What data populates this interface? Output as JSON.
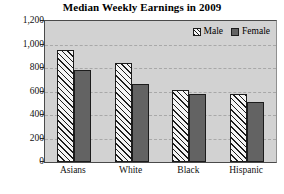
{
  "chart_data": {
    "type": "bar",
    "title": "Median Weekly Earnings in 2009",
    "xlabel": "",
    "ylabel": "",
    "categories": [
      "Asians",
      "White",
      "Black",
      "Hispanic"
    ],
    "series": [
      {
        "name": "Male",
        "values": [
          950,
          845,
          615,
          575
        ]
      },
      {
        "name": "Female",
        "values": [
          780,
          660,
          580,
          510
        ]
      }
    ],
    "ylim": [
      0,
      1200
    ],
    "yticks": [
      0,
      200,
      400,
      600,
      800,
      1000,
      1200
    ],
    "ytick_labels": [
      "0",
      "200",
      "400",
      "600",
      "800",
      "1,000",
      "1,200"
    ],
    "grid": true,
    "legend_position": "top-right",
    "colors": {
      "male": "#f4f4f4",
      "female": "#636363",
      "outline": "#1c1c1c",
      "plot_background": "#d2d2d2",
      "gridline": "#a8a8a8",
      "text": "#000000"
    }
  }
}
